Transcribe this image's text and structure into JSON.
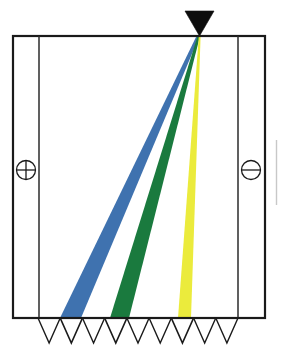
{
  "figure": {
    "width": 281,
    "height": 353,
    "background_color": "#ffffff"
  },
  "chamber": {
    "label": "separation-chamber",
    "outer_box": {
      "x": 13,
      "y": 36,
      "width": 252,
      "height": 282
    },
    "stroke_color": "#1a1a1a",
    "stroke_width": 2.2
  },
  "electrodes": [
    {
      "id": "anode",
      "polarity": "positive",
      "symbol": "plus-circle",
      "plate_x": 39,
      "center_x": 26,
      "center_y": 170,
      "radius": 9.5,
      "stroke_color": "#1a1a1a"
    },
    {
      "id": "cathode",
      "polarity": "negative",
      "symbol": "minus-circle",
      "plate_x": 238,
      "center_x": 251,
      "center_y": 170,
      "radius": 9.5,
      "stroke_color": "#1a1a1a"
    }
  ],
  "source": {
    "label": "beam-source-emitter",
    "shape": "inverted-triangle",
    "fill_color": "#0d0d0d",
    "left_x": 185,
    "right_x": 214,
    "top_y": 11,
    "apex_x": 199.5,
    "apex_y": 36
  },
  "detector_array": {
    "label": "detector-array",
    "count": 9,
    "start_x": 38,
    "end_x": 238,
    "top_y": 318,
    "depth": 25,
    "cell_width": 22.2,
    "stroke_color": "#1a1a1a",
    "cells": [
      {
        "index": 1,
        "filled": false,
        "fill_color": "none"
      },
      {
        "index": 2,
        "filled": true,
        "fill_color": "#3f72af"
      },
      {
        "index": 3,
        "filled": false,
        "fill_color": "none"
      },
      {
        "index": 4,
        "filled": true,
        "fill_color": "#1a7a3e"
      },
      {
        "index": 5,
        "filled": false,
        "fill_color": "none"
      },
      {
        "index": 6,
        "filled": false,
        "fill_color": "none"
      },
      {
        "index": 7,
        "filled": true,
        "fill_color": "#ebeb3c"
      },
      {
        "index": 8,
        "filled": false,
        "fill_color": "none"
      },
      {
        "index": 9,
        "filled": false,
        "fill_color": "none"
      }
    ]
  },
  "chart_data": {
    "type": "diagram",
    "apex": {
      "x": 199.5,
      "y": 36
    },
    "baseline_y": 318,
    "series": [
      {
        "name": "blue-beam",
        "color": "#3f72af",
        "deflection_rank": 1,
        "deflection_label": "largest",
        "apex_left_x": 196.5,
        "apex_right_x": 199.5,
        "base_left_x": 60,
        "base_right_x": 81,
        "detector_index": 2
      },
      {
        "name": "green-beam",
        "color": "#1a7a3e",
        "deflection_rank": 2,
        "deflection_label": "intermediate",
        "apex_left_x": 197.6,
        "apex_right_x": 200.0,
        "base_left_x": 110,
        "base_right_x": 129,
        "detector_index": 4
      },
      {
        "name": "yellow-beam",
        "color": "#ebeb3c",
        "deflection_rank": 3,
        "deflection_label": "smallest",
        "apex_left_x": 198.8,
        "apex_right_x": 200.6,
        "base_left_x": 178,
        "base_right_x": 191,
        "detector_index": 7
      }
    ],
    "axis_ranges": {
      "x": [
        13,
        265
      ],
      "y": [
        36,
        318
      ]
    },
    "grid": false,
    "legend": "none"
  }
}
